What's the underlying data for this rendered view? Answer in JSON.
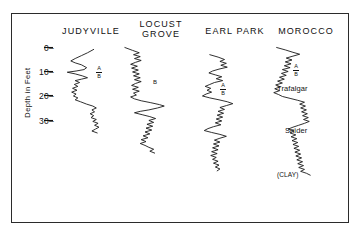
{
  "figure": {
    "axis_title": "Depth in Feet",
    "depth_unit": "feet"
  },
  "columns": [
    {
      "name": "judyville",
      "label": "JUDYVILLE"
    },
    {
      "name": "locust-grove",
      "label": "LOCUST\nGROVE"
    },
    {
      "name": "earl-park",
      "label": "EARL PARK"
    },
    {
      "name": "morocco",
      "label": "MOROCCO"
    }
  ],
  "axis": {
    "ticks": [
      {
        "label": "0–"
      },
      {
        "label": "10–"
      },
      {
        "label": "20–"
      },
      {
        "label": "30–"
      }
    ]
  },
  "markers": {
    "a": "A",
    "b": "B",
    "trafalgar": "Trafalgar",
    "snider": "Snider",
    "clay": "(CLAY)"
  },
  "chart_data": {
    "type": "line",
    "title": "",
    "xlabel": "",
    "ylabel": "Depth in Feet",
    "ylim": [
      0,
      37
    ],
    "y_ticks": [
      0,
      10,
      20,
      30
    ],
    "grid": false,
    "legend": "none",
    "orientation": "vertical-depth-logs",
    "series": [
      {
        "name": "JUDYVILLE",
        "top_depth": 0.8,
        "bottom_depth": 36.0,
        "annotations": [
          {
            "text": "A",
            "depth": 12.0
          },
          {
            "text": "B",
            "depth": 15.0
          }
        ],
        "points": [
          [
            0.72,
            0.8
          ],
          [
            0.58,
            2.2
          ],
          [
            0.44,
            3.4
          ],
          [
            0.3,
            4.6
          ],
          [
            0.2,
            5.6
          ],
          [
            0.3,
            6.4
          ],
          [
            0.44,
            7.2
          ],
          [
            0.56,
            8.4
          ],
          [
            0.5,
            9.2
          ],
          [
            0.32,
            9.8
          ],
          [
            0.12,
            10.3
          ],
          [
            0.3,
            11.0
          ],
          [
            0.46,
            11.8
          ],
          [
            0.58,
            12.6
          ],
          [
            0.44,
            13.2
          ],
          [
            0.3,
            13.8
          ],
          [
            0.4,
            14.6
          ],
          [
            0.28,
            15.4
          ],
          [
            0.36,
            16.2
          ],
          [
            0.24,
            17.0
          ],
          [
            0.34,
            17.8
          ],
          [
            0.22,
            18.6
          ],
          [
            0.32,
            19.4
          ],
          [
            0.26,
            20.2
          ],
          [
            0.36,
            21.0
          ],
          [
            0.3,
            21.8
          ],
          [
            0.42,
            22.6
          ],
          [
            0.56,
            23.6
          ],
          [
            0.7,
            24.4
          ],
          [
            0.78,
            25.2
          ],
          [
            0.68,
            26.0
          ],
          [
            0.74,
            26.8
          ],
          [
            0.64,
            27.6
          ],
          [
            0.72,
            28.4
          ],
          [
            0.66,
            29.2
          ],
          [
            0.78,
            30.0
          ],
          [
            0.7,
            30.8
          ],
          [
            0.82,
            31.6
          ],
          [
            0.74,
            32.4
          ],
          [
            0.84,
            33.2
          ],
          [
            0.76,
            34.0
          ],
          [
            0.68,
            34.8
          ],
          [
            0.8,
            35.6
          ]
        ]
      },
      {
        "name": "LOCUST GROVE",
        "top_depth": 0.0,
        "bottom_depth": 45.0,
        "annotations": [
          {
            "text": "B",
            "depth": 13.5
          }
        ],
        "points": [
          [
            0.06,
            0.0
          ],
          [
            0.22,
            1.2
          ],
          [
            0.36,
            2.2
          ],
          [
            0.24,
            3.0
          ],
          [
            0.38,
            3.8
          ],
          [
            0.26,
            4.6
          ],
          [
            0.4,
            5.4
          ],
          [
            0.28,
            6.2
          ],
          [
            0.18,
            7.0
          ],
          [
            0.32,
            7.8
          ],
          [
            0.2,
            8.6
          ],
          [
            0.34,
            9.4
          ],
          [
            0.22,
            10.2
          ],
          [
            0.36,
            11.0
          ],
          [
            0.24,
            11.8
          ],
          [
            0.38,
            12.6
          ],
          [
            0.26,
            13.4
          ],
          [
            0.4,
            14.2
          ],
          [
            0.28,
            15.0
          ],
          [
            0.2,
            15.8
          ],
          [
            0.34,
            16.6
          ],
          [
            0.22,
            17.4
          ],
          [
            0.36,
            18.2
          ],
          [
            0.24,
            19.0
          ],
          [
            0.3,
            19.8
          ],
          [
            0.18,
            20.6
          ],
          [
            0.26,
            21.4
          ],
          [
            0.4,
            22.2
          ],
          [
            0.6,
            23.0
          ],
          [
            0.78,
            23.8
          ],
          [
            0.88,
            24.4
          ],
          [
            0.74,
            25.2
          ],
          [
            0.56,
            26.0
          ],
          [
            0.38,
            26.6
          ],
          [
            0.26,
            27.2
          ],
          [
            0.42,
            28.0
          ],
          [
            0.58,
            28.8
          ],
          [
            0.7,
            29.6
          ],
          [
            0.56,
            30.4
          ],
          [
            0.66,
            31.2
          ],
          [
            0.52,
            32.0
          ],
          [
            0.64,
            32.8
          ],
          [
            0.5,
            33.6
          ],
          [
            0.62,
            34.4
          ],
          [
            0.48,
            35.2
          ],
          [
            0.58,
            36.0
          ],
          [
            0.44,
            36.8
          ],
          [
            0.54,
            37.6
          ],
          [
            0.4,
            38.4
          ],
          [
            0.5,
            39.2
          ],
          [
            0.38,
            40.0
          ],
          [
            0.48,
            40.8
          ],
          [
            0.56,
            41.6
          ],
          [
            0.66,
            42.4
          ],
          [
            0.58,
            43.2
          ],
          [
            0.68,
            44.0
          ]
        ]
      },
      {
        "name": "EARL PARK",
        "top_depth": 3.0,
        "bottom_depth": 52.0,
        "annotations": [
          {
            "text": "A",
            "depth": 17.0
          },
          {
            "text": "B",
            "depth": 20.0
          }
        ],
        "points": [
          [
            0.3,
            3.0
          ],
          [
            0.48,
            4.0
          ],
          [
            0.62,
            5.0
          ],
          [
            0.52,
            5.8
          ],
          [
            0.66,
            6.6
          ],
          [
            0.54,
            7.4
          ],
          [
            0.68,
            8.2
          ],
          [
            0.5,
            9.0
          ],
          [
            0.36,
            9.8
          ],
          [
            0.28,
            10.6
          ],
          [
            0.42,
            11.4
          ],
          [
            0.56,
            12.2
          ],
          [
            0.44,
            13.0
          ],
          [
            0.58,
            13.8
          ],
          [
            0.4,
            14.6
          ],
          [
            0.3,
            15.4
          ],
          [
            0.2,
            16.2
          ],
          [
            0.32,
            17.0
          ],
          [
            0.24,
            17.8
          ],
          [
            0.34,
            18.6
          ],
          [
            0.22,
            19.4
          ],
          [
            0.14,
            20.2
          ],
          [
            0.3,
            21.0
          ],
          [
            0.5,
            21.8
          ],
          [
            0.68,
            22.6
          ],
          [
            0.8,
            23.4
          ],
          [
            0.66,
            24.2
          ],
          [
            0.52,
            25.0
          ],
          [
            0.62,
            25.8
          ],
          [
            0.48,
            26.6
          ],
          [
            0.6,
            27.4
          ],
          [
            0.46,
            28.2
          ],
          [
            0.58,
            29.0
          ],
          [
            0.44,
            29.8
          ],
          [
            0.56,
            30.6
          ],
          [
            0.42,
            31.4
          ],
          [
            0.54,
            32.2
          ],
          [
            0.38,
            33.0
          ],
          [
            0.26,
            33.8
          ],
          [
            0.18,
            34.6
          ],
          [
            0.34,
            35.4
          ],
          [
            0.52,
            36.2
          ],
          [
            0.66,
            37.0
          ],
          [
            0.52,
            37.8
          ],
          [
            0.4,
            38.6
          ],
          [
            0.52,
            39.4
          ],
          [
            0.38,
            40.2
          ],
          [
            0.5,
            41.0
          ],
          [
            0.36,
            41.8
          ],
          [
            0.48,
            42.6
          ],
          [
            0.34,
            43.4
          ],
          [
            0.46,
            44.2
          ],
          [
            0.32,
            45.0
          ],
          [
            0.44,
            45.8
          ],
          [
            0.36,
            46.6
          ],
          [
            0.48,
            47.4
          ],
          [
            0.38,
            48.2
          ],
          [
            0.5,
            49.0
          ],
          [
            0.42,
            49.8
          ],
          [
            0.52,
            50.6
          ],
          [
            0.46,
            51.4
          ]
        ]
      },
      {
        "name": "MOROCCO",
        "top_depth": 0.0,
        "bottom_depth": 54.0,
        "annotations": [
          {
            "text": "A",
            "depth": 11.5
          },
          {
            "text": "B",
            "depth": 14.5
          },
          {
            "text": "Trafalgar",
            "depth": 17.5
          },
          {
            "text": "Snider",
            "depth": 31.0
          },
          {
            "text": "(CLAY)",
            "depth": 44.0
          }
        ],
        "points": [
          [
            0.18,
            0.0
          ],
          [
            0.36,
            1.0
          ],
          [
            0.52,
            2.0
          ],
          [
            0.66,
            2.8
          ],
          [
            0.52,
            3.6
          ],
          [
            0.38,
            4.4
          ],
          [
            0.5,
            5.2
          ],
          [
            0.36,
            6.0
          ],
          [
            0.48,
            6.8
          ],
          [
            0.34,
            7.6
          ],
          [
            0.46,
            8.4
          ],
          [
            0.3,
            9.2
          ],
          [
            0.42,
            10.0
          ],
          [
            0.28,
            10.8
          ],
          [
            0.38,
            11.6
          ],
          [
            0.24,
            12.4
          ],
          [
            0.34,
            13.2
          ],
          [
            0.2,
            14.0
          ],
          [
            0.3,
            14.8
          ],
          [
            0.16,
            15.6
          ],
          [
            0.26,
            16.4
          ],
          [
            0.14,
            17.2
          ],
          [
            0.24,
            18.0
          ],
          [
            0.12,
            18.8
          ],
          [
            0.22,
            19.6
          ],
          [
            0.3,
            20.4
          ],
          [
            0.46,
            21.2
          ],
          [
            0.62,
            22.0
          ],
          [
            0.76,
            22.8
          ],
          [
            0.66,
            23.6
          ],
          [
            0.78,
            24.4
          ],
          [
            0.68,
            25.2
          ],
          [
            0.8,
            26.0
          ],
          [
            0.7,
            26.8
          ],
          [
            0.82,
            27.6
          ],
          [
            0.72,
            28.4
          ],
          [
            0.84,
            29.2
          ],
          [
            0.74,
            30.0
          ],
          [
            0.86,
            30.8
          ],
          [
            0.76,
            31.6
          ],
          [
            0.64,
            32.4
          ],
          [
            0.52,
            33.2
          ],
          [
            0.42,
            34.0
          ],
          [
            0.54,
            34.8
          ],
          [
            0.46,
            35.6
          ],
          [
            0.58,
            36.4
          ],
          [
            0.48,
            37.2
          ],
          [
            0.6,
            38.0
          ],
          [
            0.5,
            38.8
          ],
          [
            0.62,
            39.6
          ],
          [
            0.52,
            40.4
          ],
          [
            0.64,
            41.2
          ],
          [
            0.54,
            42.0
          ],
          [
            0.66,
            42.8
          ],
          [
            0.56,
            43.6
          ],
          [
            0.68,
            44.4
          ],
          [
            0.58,
            45.2
          ],
          [
            0.7,
            46.0
          ],
          [
            0.6,
            46.8
          ],
          [
            0.72,
            47.6
          ],
          [
            0.62,
            48.4
          ],
          [
            0.74,
            49.2
          ],
          [
            0.64,
            50.0
          ],
          [
            0.76,
            50.8
          ],
          [
            0.68,
            51.6
          ],
          [
            0.8,
            52.4
          ],
          [
            0.88,
            53.2
          ]
        ]
      }
    ]
  }
}
